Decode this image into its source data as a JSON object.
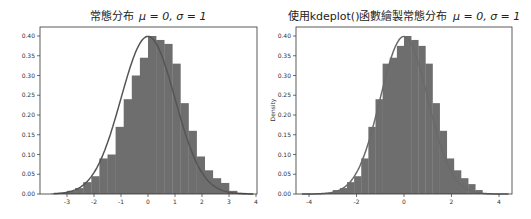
{
  "chart_data": [
    {
      "type": "bar",
      "subtype": "histogram_with_pdf_line",
      "title": "常態分布 μ = 0, σ = 1",
      "xlabel": "",
      "ylabel": "",
      "xlim": [
        -3.6,
        4.0
      ],
      "ylim": [
        0.0,
        0.42
      ],
      "xticks": [
        -3,
        -2,
        -1,
        0,
        1,
        2,
        3,
        4
      ],
      "xtick_labels": [
        "-3",
        "-2",
        "-1",
        "0",
        "1",
        "2",
        "3",
        "4"
      ],
      "yticks": [
        0.0,
        0.05,
        0.1,
        0.15,
        0.2,
        0.25,
        0.3,
        0.35,
        0.4
      ],
      "ytick_labels": [
        "0.00",
        "0.05",
        "0.10",
        "0.15",
        "0.20",
        "0.25",
        "0.30",
        "0.35",
        "0.40"
      ],
      "grid": false,
      "bar_color": "#6e6e6e",
      "line_color": "#555555",
      "bins": {
        "edges": [
          -3.6,
          -3.3,
          -3.0,
          -2.7,
          -2.4,
          -2.1,
          -1.8,
          -1.5,
          -1.2,
          -0.9,
          -0.6,
          -0.3,
          0.0,
          0.3,
          0.6,
          0.9,
          1.2,
          1.5,
          1.8,
          2.1,
          2.4,
          2.7,
          3.0,
          3.3,
          3.6
        ],
        "heights": [
          0.001,
          0.003,
          0.008,
          0.015,
          0.03,
          0.045,
          0.09,
          0.1,
          0.17,
          0.24,
          0.3,
          0.345,
          0.4,
          0.39,
          0.38,
          0.33,
          0.23,
          0.16,
          0.095,
          0.06,
          0.04,
          0.028,
          0.008,
          0.003
        ]
      },
      "line": {
        "label": "normal pdf",
        "mu": 0,
        "sigma": 1
      }
    },
    {
      "type": "bar",
      "subtype": "histogram_with_kde_line",
      "title": "使用kdeplot()函數繪製常態分布 μ = 0, σ = 1",
      "xlabel": "",
      "ylabel": "Density",
      "xlim": [
        -4.4,
        4.5
      ],
      "ylim": [
        0.0,
        0.42
      ],
      "xticks": [
        -4,
        -2,
        0,
        2,
        4
      ],
      "xtick_labels": [
        "-4",
        "-2",
        "0",
        "2",
        "4"
      ],
      "yticks": [
        0.0,
        0.05,
        0.1,
        0.15,
        0.2,
        0.25,
        0.3,
        0.35,
        0.4
      ],
      "ytick_labels": [
        "0.00",
        "0.05",
        "0.10",
        "0.15",
        "0.20",
        "0.25",
        "0.30",
        "0.35",
        "0.40"
      ],
      "grid": false,
      "bar_color": "#6e6e6e",
      "line_color": "#6a6a6a",
      "bins": {
        "edges": [
          -3.3,
          -3.0,
          -2.7,
          -2.4,
          -2.1,
          -1.8,
          -1.5,
          -1.2,
          -0.9,
          -0.6,
          -0.3,
          0.0,
          0.3,
          0.6,
          0.9,
          1.2,
          1.5,
          1.8,
          2.1,
          2.4,
          2.7,
          3.0,
          3.3
        ],
        "heights": [
          0.003,
          0.01,
          0.015,
          0.03,
          0.045,
          0.09,
          0.17,
          0.24,
          0.33,
          0.345,
          0.375,
          0.4,
          0.39,
          0.375,
          0.33,
          0.23,
          0.16,
          0.09,
          0.06,
          0.04,
          0.025,
          0.01,
          0.003
        ]
      },
      "line": {
        "label": "kde",
        "mu": 0,
        "sigma": 1
      }
    }
  ],
  "charts": {
    "left": {
      "title_prefix": "常態分布",
      "title_math": "μ = 0, σ = 1",
      "ylabel": ""
    },
    "right": {
      "title_prefix": "使用kdeplot()函數繪製常態分布",
      "title_math": "μ = 0, σ = 1",
      "ylabel": "Density"
    }
  }
}
